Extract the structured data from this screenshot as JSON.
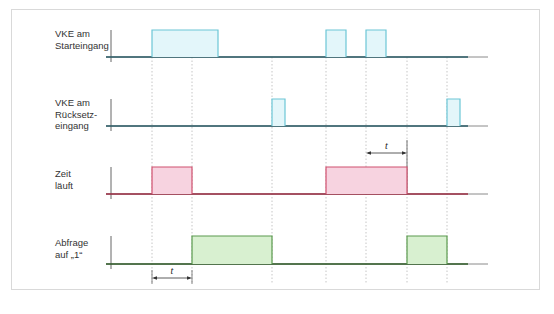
{
  "diagram": {
    "type": "timing-diagram",
    "rows": [
      {
        "id": "start",
        "label_lines": [
          "VKE am",
          "Starteingang"
        ],
        "color": "#6cc6d6",
        "fill": "#e3f6fa",
        "baseline_color": "#2a5b66",
        "pulses": [
          [
            152,
            218
          ],
          [
            326,
            346
          ],
          [
            366,
            386
          ]
        ]
      },
      {
        "id": "reset",
        "label_lines": [
          "VKE am",
          "Rücksetz-",
          "eingang"
        ],
        "color": "#6cc6d6",
        "fill": "#e3f6fa",
        "baseline_color": "#2a5b66",
        "pulses": [
          [
            272,
            285
          ],
          [
            447,
            460
          ]
        ]
      },
      {
        "id": "timer",
        "label_lines": [
          "Zeit",
          "läuft"
        ],
        "color": "#d0506e",
        "fill": "#f7d3e0",
        "baseline_color": "#9a2a40",
        "pulses": [
          [
            152,
            192
          ],
          [
            326,
            407
          ]
        ]
      },
      {
        "id": "query",
        "label_lines": [
          "Abfrage",
          "auf „1“"
        ],
        "color": "#5a9a4e",
        "fill": "#d8f0d0",
        "baseline_color": "#2e5a26",
        "pulses": [
          [
            192,
            272
          ],
          [
            407,
            447
          ]
        ]
      }
    ],
    "guides_x": [
      152,
      192,
      272,
      326,
      366,
      407,
      447
    ],
    "dimensions": [
      {
        "label": "t",
        "x1": 366,
        "x2": 407,
        "y": 153
      },
      {
        "label": "t",
        "x1": 152,
        "x2": 192,
        "y": 278
      }
    ]
  }
}
